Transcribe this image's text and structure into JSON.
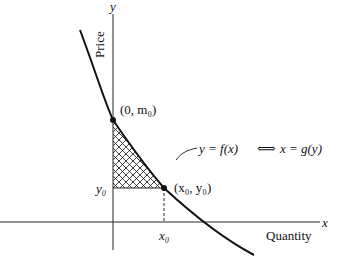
{
  "axes": {
    "y_label": "y",
    "x_label": "x",
    "y_title": "Price",
    "x_title": "Quantity"
  },
  "points": {
    "intercept_label": "(0, m₀)",
    "equilibrium_label": "(x₀, y₀)"
  },
  "ticks": {
    "y0": "y₀",
    "x0": "x₀"
  },
  "curve_label": {
    "left": "y = f(x)",
    "arrow": "⟺",
    "right": "x = g(y)"
  },
  "colors": {
    "ink": "#111111",
    "background": "#ffffff"
  }
}
